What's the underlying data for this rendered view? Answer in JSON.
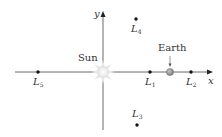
{
  "diagram": {
    "type": "lagrange-points",
    "axes": {
      "x_label": "x",
      "y_label": "y"
    },
    "bodies": {
      "sun": "Sun",
      "earth": "Earth"
    },
    "points": [
      {
        "id": "L1",
        "letter": "L",
        "sub": "1"
      },
      {
        "id": "L2",
        "letter": "L",
        "sub": "2"
      },
      {
        "id": "L3",
        "letter": "L",
        "sub": "3"
      },
      {
        "id": "L4",
        "letter": "L",
        "sub": "4"
      },
      {
        "id": "L5",
        "letter": "L",
        "sub": "5"
      }
    ],
    "colors": {
      "axis": "#333333",
      "point": "#111111",
      "earth": "#9a9a9a",
      "sun": "#f0f0f0"
    }
  }
}
